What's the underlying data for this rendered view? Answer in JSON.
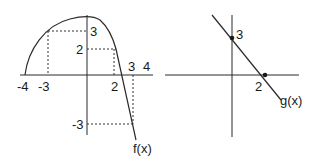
{
  "figure": {
    "left_graph": {
      "function_label": "f(x)",
      "x_ticks": [
        "-4",
        "-3",
        "2",
        "3",
        "4"
      ],
      "y_ticks": [
        "3",
        "2",
        "-3"
      ],
      "description": "Curve rising from (-4,0) to a maximum near (0,3.5), passing (-3,3) and (2,2), then a line descending through (3,-3)"
    },
    "right_graph": {
      "function_label": "g(x)",
      "x_ticks": [
        "2"
      ],
      "y_ticks": [
        "3"
      ],
      "description": "Straight line with points (0,3) and (2,0)"
    }
  },
  "colors": {
    "stroke": "#2a2a2a",
    "background": "#ffffff"
  }
}
